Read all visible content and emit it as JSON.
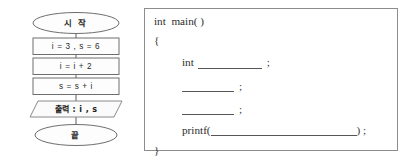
{
  "flowchart": {
    "title": "flowchart",
    "nodes": [
      {
        "id": "start",
        "shape": "ellipse",
        "label": "시 작"
      },
      {
        "id": "init",
        "shape": "process",
        "label": "i = 3 , s = 6"
      },
      {
        "id": "step",
        "shape": "process",
        "label": "i = i + 2"
      },
      {
        "id": "sum",
        "shape": "process",
        "label": "s = s + i"
      },
      {
        "id": "output",
        "shape": "parallelogram",
        "label": "출력 : i , s"
      },
      {
        "id": "end",
        "shape": "ellipse",
        "label": "끝"
      }
    ],
    "colors": {
      "stroke": "#6e6e6e",
      "fill": "#fdfdfd",
      "text": "#2a2a2a",
      "connector": "#6b6b6b"
    }
  },
  "code": {
    "language": "c",
    "lines": {
      "main": "int  main( )",
      "open_brace": "{",
      "decl_keyword": "int",
      "decl_semicolon": ";",
      "stmt1_semicolon": ";",
      "stmt2_semicolon": ";",
      "printf_keyword": "printf(",
      "printf_close": ") ;",
      "close_brace": "}"
    },
    "blanks": [
      {
        "id": "decl-blank",
        "value": ""
      },
      {
        "id": "stmt1-blank",
        "value": ""
      },
      {
        "id": "stmt2-blank",
        "value": ""
      },
      {
        "id": "printf-blank",
        "value": ""
      }
    ],
    "border_color": "#8d8d8d"
  }
}
